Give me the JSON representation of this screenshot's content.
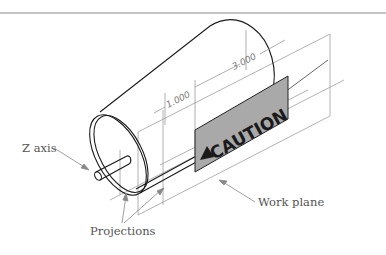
{
  "figure": {
    "labels": {
      "z_axis": "Z axis",
      "projections": "Projections",
      "work_plane": "Work plane"
    },
    "dimensions": {
      "small": "1.000",
      "large": "3.000"
    },
    "sign": {
      "text": "CAUTION",
      "icon": "warning-triangle-icon",
      "fill": "#a9a9a9"
    },
    "colors": {
      "outline": "#1a1a1a",
      "construction": "#9a9a9a",
      "leader": "#888888",
      "top_rule": "#777777"
    }
  }
}
